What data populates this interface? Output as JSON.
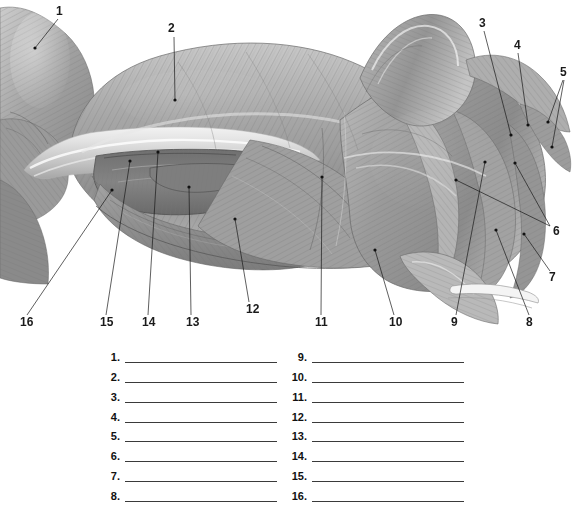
{
  "figure": {
    "kind": "anatomical-illustration",
    "style": "grayscale pencil/airbrush rendering",
    "background_color": "#ffffff",
    "ink_color": "#1a1a1a",
    "callouts": [
      {
        "label": "1",
        "text_x": 56,
        "text_y": 5,
        "dot_x": 35,
        "dot_y": 48,
        "line_x1": 58,
        "line_y1": 19,
        "line_x2": 35,
        "line_y2": 48
      },
      {
        "label": "2",
        "text_x": 168,
        "text_y": 22,
        "dot_x": 175,
        "dot_y": 100,
        "line_x1": 174,
        "line_y1": 37,
        "line_x2": 175,
        "line_y2": 100
      },
      {
        "label": "3",
        "text_x": 479,
        "text_y": 17,
        "dot_x": 511,
        "dot_y": 135,
        "line_x1": 484,
        "line_y1": 31,
        "line_x2": 511,
        "line_y2": 135
      },
      {
        "label": "4",
        "text_x": 514,
        "text_y": 39,
        "dot_x": 528,
        "dot_y": 125,
        "line_x1": 518,
        "line_y1": 53,
        "line_x2": 528,
        "line_y2": 125
      },
      {
        "label": "5",
        "text_x": 560,
        "text_y": 66,
        "dot_x": 548,
        "dot_y": 122,
        "line_x1": 563,
        "line_y1": 80,
        "line_x2": 548,
        "line_y2": 122
      },
      {
        "label": "5b",
        "text_x": 560,
        "text_y": 66,
        "dot_x": 552,
        "dot_y": 147,
        "line_x1": 564,
        "line_y1": 80,
        "line_x2": 552,
        "line_y2": 147
      },
      {
        "label": "6",
        "text_x": 553,
        "text_y": 225,
        "dot_x": 456,
        "dot_y": 180,
        "line_x1": 550,
        "line_y1": 226,
        "line_x2": 456,
        "line_y2": 180
      },
      {
        "label": "6b",
        "text_x": 553,
        "text_y": 225,
        "dot_x": 515,
        "dot_y": 163,
        "line_x1": 550,
        "line_y1": 226,
        "line_x2": 515,
        "line_y2": 163
      },
      {
        "label": "7",
        "text_x": 549,
        "text_y": 271,
        "dot_x": 524,
        "dot_y": 234,
        "line_x1": 550,
        "line_y1": 271,
        "line_x2": 524,
        "line_y2": 234
      },
      {
        "label": "8",
        "text_x": 526,
        "text_y": 316,
        "dot_x": 496,
        "dot_y": 230,
        "line_x1": 529,
        "line_y1": 315,
        "line_x2": 496,
        "line_y2": 230
      },
      {
        "label": "9",
        "text_x": 451,
        "text_y": 316,
        "dot_x": 485,
        "dot_y": 162,
        "line_x1": 456,
        "line_y1": 315,
        "line_x2": 485,
        "line_y2": 162
      },
      {
        "label": "10",
        "text_x": 389,
        "text_y": 316,
        "dot_x": 375,
        "dot_y": 250,
        "line_x1": 394,
        "line_y1": 315,
        "line_x2": 375,
        "line_y2": 250
      },
      {
        "label": "11",
        "text_x": 315,
        "text_y": 316,
        "dot_x": 322,
        "dot_y": 177,
        "line_x1": 321,
        "line_y1": 315,
        "line_x2": 322,
        "line_y2": 177
      },
      {
        "label": "12",
        "text_x": 246,
        "text_y": 303,
        "dot_x": 235,
        "dot_y": 219,
        "line_x1": 249,
        "line_y1": 302,
        "line_x2": 235,
        "line_y2": 219
      },
      {
        "label": "13",
        "text_x": 186,
        "text_y": 316,
        "dot_x": 189,
        "dot_y": 187,
        "line_x1": 191,
        "line_y1": 315,
        "line_x2": 189,
        "line_y2": 187
      },
      {
        "label": "14",
        "text_x": 142,
        "text_y": 316,
        "dot_x": 158,
        "dot_y": 152,
        "line_x1": 148,
        "line_y1": 315,
        "line_x2": 158,
        "line_y2": 152
      },
      {
        "label": "15",
        "text_x": 100,
        "text_y": 316,
        "dot_x": 130,
        "dot_y": 161,
        "line_x1": 106,
        "line_y1": 315,
        "line_x2": 130,
        "line_y2": 161
      },
      {
        "label": "16",
        "text_x": 20,
        "text_y": 316,
        "dot_x": 112,
        "dot_y": 190,
        "line_x1": 27,
        "line_y1": 315,
        "line_x2": 112,
        "line_y2": 190
      }
    ]
  },
  "answer_key": {
    "left_column": [
      {
        "number": "1."
      },
      {
        "number": "2."
      },
      {
        "number": "3."
      },
      {
        "number": "4."
      },
      {
        "number": "5."
      },
      {
        "number": "6."
      },
      {
        "number": "7."
      },
      {
        "number": "8."
      }
    ],
    "right_column": [
      {
        "number": "9."
      },
      {
        "number": "10."
      },
      {
        "number": "11."
      },
      {
        "number": "12."
      },
      {
        "number": "13."
      },
      {
        "number": "14."
      },
      {
        "number": "15."
      },
      {
        "number": "16."
      }
    ],
    "blank_value": ""
  }
}
